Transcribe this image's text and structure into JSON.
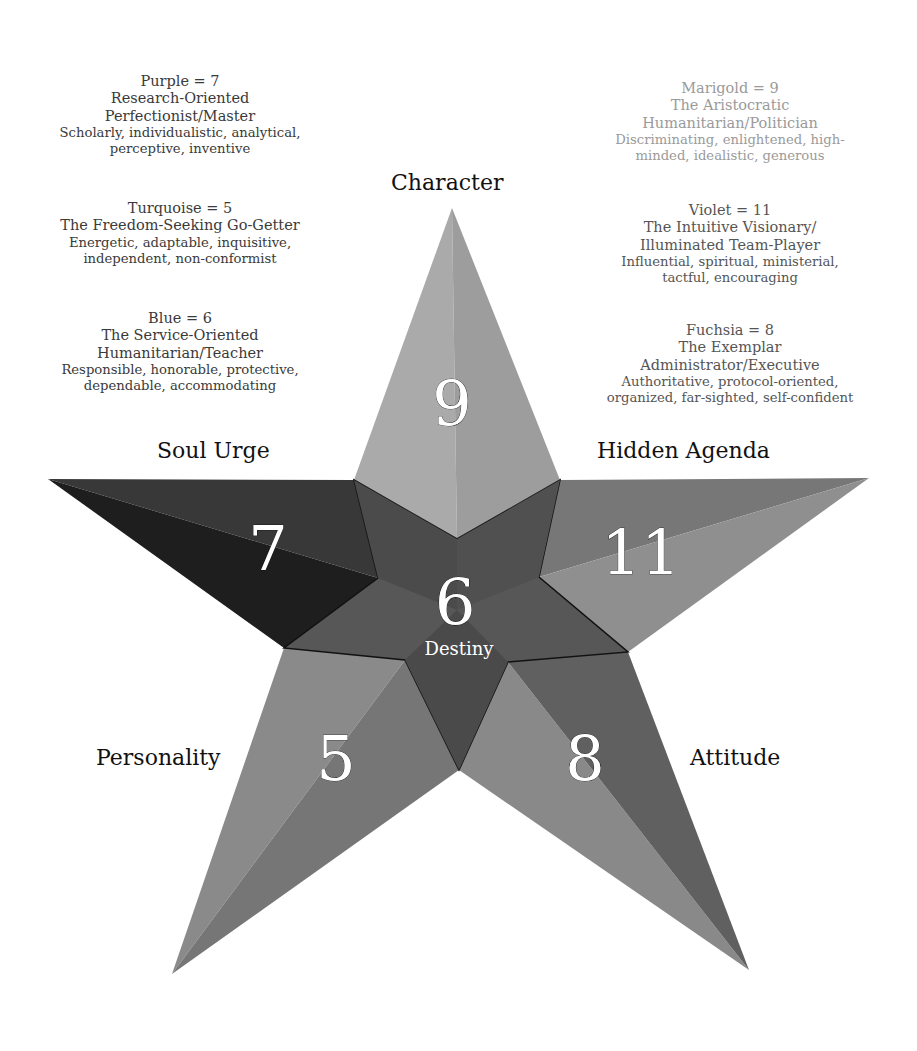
{
  "legend": {
    "left": [
      {
        "heading": "Purple = 7",
        "subtitle_lines": [
          "Research-Oriented",
          "Perfectionist/Master"
        ],
        "traits_lines": [
          "Scholarly, individualistic, analytical,",
          "perceptive, inventive"
        ]
      },
      {
        "heading": "Turquoise = 5",
        "subtitle_lines": [
          "The Freedom-Seeking Go-Getter"
        ],
        "traits_lines": [
          "Energetic, adaptable, inquisitive,",
          "independent, non-conformist"
        ]
      },
      {
        "heading": "Blue = 6",
        "subtitle_lines": [
          "The Service-Oriented",
          "Humanitarian/Teacher"
        ],
        "traits_lines": [
          "Responsible, honorable, protective,",
          "dependable, accommodating"
        ]
      }
    ],
    "right": [
      {
        "heading": "Marigold = 9",
        "subtitle_lines": [
          "The Aristocratic",
          "Humanitarian/Politician"
        ],
        "traits_lines": [
          "Discriminating, enlightened, high-",
          "minded, idealistic, generous"
        ]
      },
      {
        "heading": "Violet = 11",
        "subtitle_lines": [
          "The Intuitive Visionary/",
          "Illuminated Team-Player"
        ],
        "traits_lines": [
          "Influential, spiritual, ministerial,",
          "tactful, encouraging"
        ]
      },
      {
        "heading": "Fuchsia = 8",
        "subtitle_lines": [
          "The Exemplar",
          "Administrator/Executive"
        ],
        "traits_lines": [
          "Authoritative, protocol-oriented,",
          "organized, far-sighted, self-confident"
        ]
      }
    ]
  },
  "star": {
    "arms": {
      "character": {
        "label": "Character",
        "number": "9"
      },
      "soul_urge": {
        "label": "Soul Urge",
        "number": "7"
      },
      "hidden_agenda": {
        "label": "Hidden Agenda",
        "number": "11"
      },
      "personality": {
        "label": "Personality",
        "number": "5"
      },
      "attitude": {
        "label": "Attitude",
        "number": "8"
      }
    },
    "center": {
      "label": "Destiny",
      "number": "6"
    }
  },
  "colors": {
    "character_light": "#a9a9a9",
    "character_dark": "#9c9c9c",
    "soul_urge_light": "#3a3a3a",
    "soul_urge_dark": "#1f1f1f",
    "hidden_agenda_light": "#8c8c8c",
    "hidden_agenda_dark": "#707070",
    "personality_light": "#8a8a8a",
    "personality_dark": "#6e6e6e",
    "attitude_light": "#838383",
    "attitude_dark": "#5f5f5f",
    "destiny": "#555555",
    "destiny_dark": "#474747"
  }
}
